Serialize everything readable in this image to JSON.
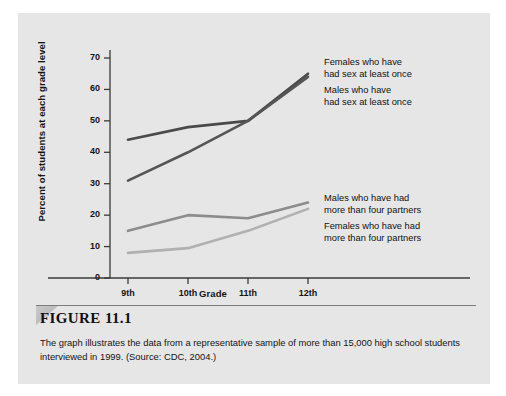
{
  "figure": {
    "number_label": "FIGURE 11.1",
    "caption": "The graph illustrates the data from a representative sample of more than 15,000 high school students interviewed in 1999.  (Source: CDC, 2004.)"
  },
  "colors": {
    "page_background": "#ffffff",
    "figure_background": "#e6e6e6",
    "axis": "#3a3a3a",
    "text": "#141414",
    "series_females_sex": "#4a4a4a",
    "series_males_sex": "#555555",
    "series_males_partners": "#8c8c8c",
    "series_females_partners": "#b0b0b0"
  },
  "chart_data": {
    "type": "line",
    "title": "",
    "xlabel": "Grade",
    "ylabel": "Percent of students at each grade level",
    "categories": [
      "9th",
      "10th",
      "11th",
      "12th"
    ],
    "xticklabels": [
      "9th",
      "10th",
      "11th",
      "12th"
    ],
    "yticklabels": [
      "0",
      "10",
      "20",
      "30",
      "40",
      "50",
      "60",
      "70"
    ],
    "yticks": [
      0,
      10,
      20,
      30,
      40,
      50,
      60,
      70
    ],
    "ylim": [
      0,
      74
    ],
    "grid": false,
    "legend": "inline-annotations",
    "series": [
      {
        "name": "Females who have had sex at least once",
        "label_text": "Females who have\nhad sex at least once",
        "color": "#4a4a4a",
        "values": [
          44,
          48,
          50,
          65
        ]
      },
      {
        "name": "Males who have had sex at least once",
        "label_text": "Males who have\nhad sex at least once",
        "color": "#555555",
        "values": [
          31,
          40,
          50,
          64
        ]
      },
      {
        "name": "Males who have had more than four partners",
        "label_text": "Males who have had\nmore than four partners",
        "color": "#8c8c8c",
        "values": [
          15,
          20,
          19,
          24
        ]
      },
      {
        "name": "Females who have had more than four partners",
        "label_text": "Females who have had\nmore than four partners",
        "color": "#b0b0b0",
        "values": [
          8,
          9.5,
          15,
          22
        ]
      }
    ]
  }
}
